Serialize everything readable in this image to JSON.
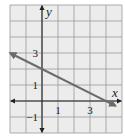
{
  "chart_data": {
    "type": "line",
    "title": "",
    "xlabel": "x",
    "ylabel": "y",
    "xlim": [
      -2,
      5
    ],
    "ylim": [
      -2,
      6
    ],
    "grid": true,
    "grid_step": 1,
    "x_ticks": [
      {
        "value": 1,
        "label": "1"
      },
      {
        "value": 3,
        "label": "3"
      }
    ],
    "y_ticks": [
      {
        "value": 3,
        "label": "3"
      },
      {
        "value": 1,
        "label": "1"
      },
      {
        "value": -1,
        "label": "−1"
      }
    ],
    "series": [
      {
        "name": "line",
        "equation": "y = -x/2 + 2",
        "x": [
          -2,
          4.6
        ],
        "y": [
          3,
          -0.3
        ],
        "color": "#6a6a6a",
        "arrows": "both"
      }
    ]
  }
}
